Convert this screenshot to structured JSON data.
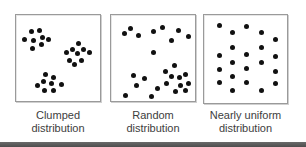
{
  "figure": {
    "panels": [
      {
        "id": "clumped",
        "caption_line1": "Clumped",
        "caption_line2": "distribution",
        "box": {
          "left": 15,
          "top": 14,
          "width": 86,
          "height": 88
        },
        "dots": [
          [
            15,
            16
          ],
          [
            23,
            15
          ],
          [
            8,
            24
          ],
          [
            17,
            25
          ],
          [
            26,
            22
          ],
          [
            32,
            24
          ],
          [
            16,
            33
          ],
          [
            25,
            29
          ],
          [
            62,
            28
          ],
          [
            56,
            34
          ],
          [
            50,
            37
          ],
          [
            61,
            38
          ],
          [
            67,
            34
          ],
          [
            73,
            37
          ],
          [
            53,
            45
          ],
          [
            65,
            45
          ],
          [
            58,
            49
          ],
          [
            29,
            59
          ],
          [
            37,
            62
          ],
          [
            27,
            66
          ],
          [
            35,
            68
          ],
          [
            45,
            69
          ],
          [
            21,
            70
          ],
          [
            28,
            75
          ],
          [
            37,
            75
          ]
        ]
      },
      {
        "id": "random",
        "caption_line1": "Random",
        "caption_line2": "distribution",
        "box": {
          "left": 110,
          "top": 14,
          "width": 86,
          "height": 88
        },
        "dots": [
          [
            13,
            18
          ],
          [
            19,
            13
          ],
          [
            27,
            20
          ],
          [
            42,
            16
          ],
          [
            51,
            12
          ],
          [
            67,
            15
          ],
          [
            60,
            25
          ],
          [
            77,
            21
          ],
          [
            42,
            37
          ],
          [
            63,
            50
          ],
          [
            54,
            56
          ],
          [
            60,
            61
          ],
          [
            68,
            62
          ],
          [
            74,
            59
          ],
          [
            22,
            60
          ],
          [
            33,
            63
          ],
          [
            25,
            70
          ],
          [
            46,
            73
          ],
          [
            55,
            68
          ],
          [
            69,
            70
          ],
          [
            77,
            68
          ],
          [
            64,
            76
          ],
          [
            74,
            75
          ],
          [
            14,
            80
          ],
          [
            40,
            81
          ]
        ]
      },
      {
        "id": "nearly-uniform",
        "caption_line1": "Nearly uniform",
        "caption_line2": "distribution",
        "box": {
          "left": 203,
          "top": 14,
          "width": 85,
          "height": 90
        },
        "dots": [
          [
            15,
            10
          ],
          [
            28,
            17
          ],
          [
            42,
            11
          ],
          [
            57,
            17
          ],
          [
            71,
            24
          ],
          [
            28,
            32
          ],
          [
            57,
            32
          ],
          [
            15,
            40
          ],
          [
            42,
            39
          ],
          [
            71,
            41
          ],
          [
            28,
            47
          ],
          [
            57,
            47
          ],
          [
            15,
            54
          ],
          [
            42,
            53
          ],
          [
            71,
            56
          ],
          [
            28,
            61
          ],
          [
            15,
            67
          ],
          [
            42,
            67
          ],
          [
            71,
            68
          ],
          [
            28,
            75
          ],
          [
            57,
            75
          ]
        ]
      }
    ],
    "colors": {
      "dot": "#111111",
      "border": "#9a9a9a",
      "caption": "#3d3d3d",
      "bottom_strip": "#5a5a5a"
    }
  }
}
